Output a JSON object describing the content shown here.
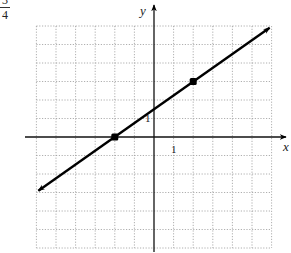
{
  "corner_fraction": {
    "numerator": "3",
    "denominator": "4"
  },
  "chart_data": {
    "type": "line",
    "title": "",
    "xlabel": "x",
    "ylabel": "y",
    "xlim": [
      -6,
      6
    ],
    "ylim": [
      -6,
      6
    ],
    "grid": true,
    "grid_style": "dotted",
    "tick_labels": {
      "x": "1",
      "y": "1"
    },
    "slope": "3/4",
    "equation": "y = 0.75x + 1.5",
    "series": [
      {
        "name": "line",
        "style": "solid, arrows both ends",
        "x": [
          -5.9,
          5.9
        ],
        "y": [
          -2.9,
          5.9
        ]
      }
    ],
    "points": [
      {
        "x": -2,
        "y": 0
      },
      {
        "x": 2,
        "y": 3
      }
    ]
  },
  "colors": {
    "grid": "#9a9a9a",
    "axis": "#111111",
    "line": "#000000"
  }
}
